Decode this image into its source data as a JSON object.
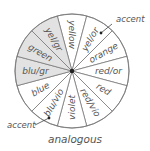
{
  "diagram": {
    "caption": "analogous",
    "center": {
      "x": 72,
      "y": 71
    },
    "radius": 57,
    "colors": {
      "shaded": "#e2e2e2",
      "unshaded": "#ffffff",
      "stroke": "#7a7a7a",
      "text": "#555555",
      "hub": "#222222"
    },
    "segments": [
      {
        "label": "yellow",
        "angle": -90,
        "shaded": false
      },
      {
        "label": "yel/or",
        "angle": -60,
        "shaded": false
      },
      {
        "label": "orange",
        "angle": -30,
        "shaded": false
      },
      {
        "label": "red/or",
        "angle": 0,
        "shaded": false
      },
      {
        "label": "red",
        "angle": 30,
        "shaded": false
      },
      {
        "label": "red/vio",
        "angle": 60,
        "shaded": false
      },
      {
        "label": "violet",
        "angle": 90,
        "shaded": false
      },
      {
        "label": "blu/vio",
        "angle": 120,
        "shaded": false
      },
      {
        "label": "blue",
        "angle": 150,
        "shaded": false
      },
      {
        "label": "blu/gr",
        "angle": 180,
        "shaded": true
      },
      {
        "label": "green",
        "angle": 210,
        "shaded": true
      },
      {
        "label": "yel/gr",
        "angle": 240,
        "shaded": true
      }
    ],
    "accents": [
      {
        "label": "accent",
        "text_x": 116,
        "text_y": 22,
        "line": [
          [
            112,
            24
          ],
          [
            101,
            33
          ]
        ],
        "dot": [
          101,
          33
        ],
        "target": "yel/or"
      },
      {
        "label": "accent",
        "text_x": 7,
        "text_y": 128,
        "line": [
          [
            35,
            125
          ],
          [
            49,
            118
          ]
        ],
        "dot": [
          49,
          118
        ],
        "target": "blu/vio"
      }
    ]
  }
}
